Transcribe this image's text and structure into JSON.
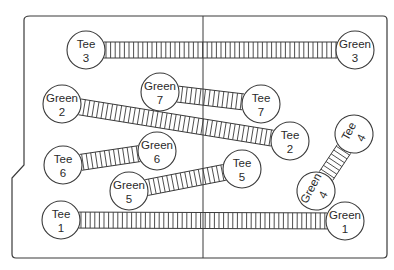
{
  "diagram": {
    "title": "",
    "board": {
      "stroke": "#3a3a3a",
      "fill": "#ffffff",
      "center_line_x": 203
    },
    "holes": [
      {
        "id": 3,
        "tee": {
          "label": "Tee",
          "num": "3",
          "x": 86,
          "y": 50,
          "r": 19,
          "rot": 0
        },
        "green": {
          "label": "Green",
          "num": "3",
          "x": 355,
          "y": 50,
          "r": 19,
          "rot": 0
        }
      },
      {
        "id": 7,
        "tee": {
          "label": "Tee",
          "num": "7",
          "x": 261,
          "y": 104,
          "r": 19,
          "rot": 0
        },
        "green": {
          "label": "Green",
          "num": "7",
          "x": 160,
          "y": 92,
          "r": 19,
          "rot": 0
        }
      },
      {
        "id": 2,
        "tee": {
          "label": "Tee",
          "num": "2",
          "x": 290,
          "y": 141,
          "r": 19,
          "rot": 0
        },
        "green": {
          "label": "Green",
          "num": "2",
          "x": 62,
          "y": 104,
          "r": 19,
          "rot": 0
        }
      },
      {
        "id": 4,
        "tee": {
          "label": "Tee",
          "num": "4",
          "x": 354,
          "y": 134,
          "r": 19,
          "rot": -62
        },
        "green": {
          "label": "Green",
          "num": "4",
          "x": 316,
          "y": 191,
          "r": 19,
          "rot": -62
        }
      },
      {
        "id": 6,
        "tee": {
          "label": "Tee",
          "num": "6",
          "x": 63,
          "y": 165,
          "r": 19,
          "rot": 0
        },
        "green": {
          "label": "Green",
          "num": "6",
          "x": 157,
          "y": 151,
          "r": 19,
          "rot": 0
        }
      },
      {
        "id": 5,
        "tee": {
          "label": "Tee",
          "num": "5",
          "x": 242,
          "y": 169,
          "r": 19,
          "rot": 0
        },
        "green": {
          "label": "Green",
          "num": "5",
          "x": 129,
          "y": 191,
          "r": 19,
          "rot": 0
        }
      },
      {
        "id": 1,
        "tee": {
          "label": "Tee",
          "num": "1",
          "x": 61,
          "y": 220,
          "r": 19,
          "rot": 0
        },
        "green": {
          "label": "Green",
          "num": "1",
          "x": 345,
          "y": 221,
          "r": 19,
          "rot": 0
        }
      }
    ],
    "track": {
      "half_width": 8,
      "rung_spacing": 4.6
    }
  }
}
